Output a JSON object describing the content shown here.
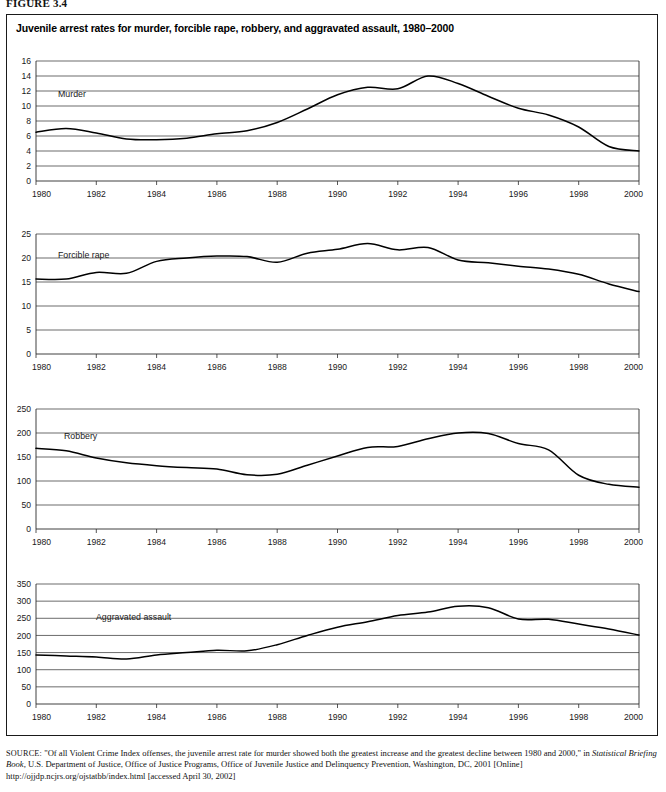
{
  "figure": {
    "number_label": "FIGURE 3.4",
    "title": "Juvenile arrest rates for murder, forcible rape, robbery, and aggravated assault, 1980–2000"
  },
  "source": {
    "label": "SOURCE:",
    "line1": "\"Of all Violent Crime Index offenses, the juvenile arrest rate for murder showed both the greatest increase and the greatest decline between 1980",
    "line2_pre": "and 2000,\"  in ",
    "line2_italic": "Statistical Briefing Book,",
    "line2_post": " U.S. Department of Justice, Office of Justice Programs, Office of Juvenile Justice and Delinquency Prevention,",
    "line3": "Washington, DC, 2001 [Online] http://ojjdp.ncjrs.org/ojstatbb/index.html [accessed April 30, 2002]"
  },
  "chart_data": [
    {
      "type": "line",
      "title": "Murder",
      "series_label": "Murder",
      "xlabel": "",
      "ylabel": "",
      "xlim": [
        1980,
        2000
      ],
      "ylim": [
        0,
        16
      ],
      "yticks": [
        0,
        2,
        4,
        6,
        8,
        10,
        12,
        14,
        16
      ],
      "xticks": [
        1980,
        1982,
        1984,
        1986,
        1988,
        1990,
        1992,
        1994,
        1996,
        1998,
        2000
      ],
      "grid": true,
      "legend": "none",
      "x": [
        1980,
        1981,
        1982,
        1983,
        1984,
        1985,
        1986,
        1987,
        1988,
        1989,
        1990,
        1991,
        1992,
        1993,
        1994,
        1995,
        1996,
        1997,
        1998,
        1999,
        2000
      ],
      "values": [
        6.5,
        7.0,
        6.4,
        5.6,
        5.5,
        5.7,
        6.3,
        6.7,
        7.8,
        9.6,
        11.5,
        12.5,
        12.3,
        14.0,
        13.0,
        11.3,
        9.7,
        8.8,
        7.2,
        4.6,
        4.0
      ]
    },
    {
      "type": "line",
      "title": "Forcible rape",
      "series_label": "Forcible rape",
      "xlabel": "",
      "ylabel": "",
      "xlim": [
        1980,
        2000
      ],
      "ylim": [
        0,
        25
      ],
      "yticks": [
        0,
        5,
        10,
        15,
        20,
        25
      ],
      "xticks": [
        1980,
        1982,
        1984,
        1986,
        1988,
        1990,
        1992,
        1994,
        1996,
        1998,
        2000
      ],
      "grid": true,
      "legend": "none",
      "x": [
        1980,
        1981,
        1982,
        1983,
        1984,
        1985,
        1986,
        1987,
        1988,
        1989,
        1990,
        1991,
        1992,
        1993,
        1994,
        1995,
        1996,
        1997,
        1998,
        1999,
        2000
      ],
      "values": [
        15.6,
        15.6,
        17.0,
        16.8,
        19.3,
        20.0,
        20.4,
        20.3,
        19.1,
        21.0,
        21.8,
        23.0,
        21.7,
        22.2,
        19.6,
        19.0,
        18.3,
        17.7,
        16.6,
        14.6,
        13.0
      ]
    },
    {
      "type": "line",
      "title": "Robbery",
      "series_label": "Robbery",
      "xlabel": "",
      "ylabel": "",
      "xlim": [
        1980,
        2000
      ],
      "ylim": [
        0,
        250
      ],
      "yticks": [
        0,
        50,
        100,
        150,
        200,
        250
      ],
      "xticks": [
        1980,
        1982,
        1984,
        1986,
        1988,
        1990,
        1992,
        1994,
        1996,
        1998,
        2000
      ],
      "grid": true,
      "legend": "none",
      "x": [
        1980,
        1981,
        1982,
        1983,
        1984,
        1985,
        1986,
        1987,
        1988,
        1989,
        1990,
        1991,
        1992,
        1993,
        1994,
        1995,
        1996,
        1997,
        1998,
        1999,
        2000
      ],
      "values": [
        168,
        163,
        148,
        138,
        132,
        128,
        125,
        113,
        114,
        133,
        152,
        170,
        172,
        188,
        200,
        199,
        178,
        165,
        112,
        93,
        87
      ]
    },
    {
      "type": "line",
      "title": "Aggravated assault",
      "series_label": "Aggravated assault",
      "xlabel": "",
      "ylabel": "",
      "xlim": [
        1980,
        2000
      ],
      "ylim": [
        0,
        350
      ],
      "yticks": [
        0,
        50,
        100,
        150,
        200,
        250,
        300,
        350
      ],
      "xticks": [
        1980,
        1982,
        1984,
        1986,
        1988,
        1990,
        1992,
        1994,
        1996,
        1998,
        2000
      ],
      "grid": true,
      "legend": "none",
      "x": [
        1980,
        1981,
        1982,
        1983,
        1984,
        1985,
        1986,
        1987,
        1988,
        1989,
        1990,
        1991,
        1992,
        1993,
        1994,
        1995,
        1996,
        1997,
        1998,
        1999,
        2000
      ],
      "values": [
        143,
        140,
        137,
        131,
        143,
        150,
        157,
        155,
        173,
        200,
        224,
        240,
        258,
        268,
        285,
        281,
        248,
        247,
        233,
        219,
        201
      ]
    }
  ],
  "panel_layout": [
    {
      "name": "murder",
      "top": 55,
      "height": 158
    },
    {
      "name": "forcible-rape",
      "top": 228,
      "height": 158
    },
    {
      "name": "robbery",
      "top": 403,
      "height": 158
    },
    {
      "name": "aggravated-assault",
      "top": 578,
      "height": 158
    }
  ]
}
